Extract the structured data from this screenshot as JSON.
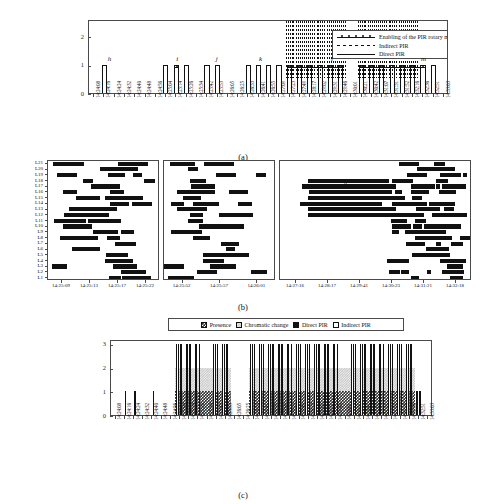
{
  "figure": {
    "panels": [
      {
        "id": "a",
        "caption": "(a)"
      },
      {
        "id": "b",
        "caption": "(b)"
      },
      {
        "id": "c",
        "caption": "(c)"
      }
    ]
  },
  "panel_a": {
    "caption": "(a)",
    "legend": {
      "items": [
        {
          "label": "Enabling of the PIR rotary mechanism",
          "symbol": "line-with-markers"
        },
        {
          "label": "Indirect PIR",
          "symbol": "dashed-line"
        },
        {
          "label": "Direct PIR",
          "symbol": "solid-line"
        }
      ]
    },
    "y_axis": {
      "ticks": [
        "0",
        "1",
        "2"
      ],
      "min": 0,
      "max": 2.6
    },
    "markers": [
      {
        "label": "h",
        "x_frac": 0.055
      },
      {
        "label": "i",
        "x_frac": 0.245
      },
      {
        "label": "j",
        "x_frac": 0.355
      },
      {
        "label": "k",
        "x_frac": 0.475
      },
      {
        "label": "l",
        "x_frac": 0.675
      },
      {
        "label": "m",
        "x_frac": 0.925
      }
    ]
  },
  "panel_b": {
    "caption": "(b)",
    "y_labels": [
      "L21",
      "L20",
      "L19",
      "L18",
      "L17",
      "L16",
      "L15",
      "L14",
      "L13",
      "L12",
      "L11",
      "L10",
      "L9",
      "L8",
      "L7",
      "L6",
      "L5",
      "L4",
      "L3",
      "L2",
      "L1"
    ],
    "annotation": "h",
    "subplots": [
      {
        "x_labels": [
          "14:25:09",
          "14:25:13",
          "14:25:17",
          "14:25:22"
        ]
      },
      {
        "x_labels": [
          "14:25:52",
          "14:25:57",
          "14:26:01"
        ]
      },
      {
        "x_labels": [
          "14:27:16",
          "14:28:17",
          "14:29:41",
          "14:30:23",
          "14:31:21",
          "14:32:18"
        ]
      }
    ]
  },
  "panel_c": {
    "caption": "(c)",
    "legend": {
      "items": [
        {
          "label": "Presence",
          "swatch": "checkered-dark"
        },
        {
          "label": "Chromatic change",
          "swatch": "checkered-light"
        },
        {
          "label": "Direct PIR",
          "swatch": "solid-black"
        },
        {
          "label": "Indirect PIR",
          "swatch": "white-outline"
        }
      ]
    },
    "y_axis": {
      "ticks": [
        "0",
        "1",
        "2",
        "3"
      ],
      "min": 0,
      "max": 3.2
    }
  },
  "x_axis_times": [
    "14:24:08",
    "14:24:16",
    "14:24:24",
    "14:24:32",
    "14:24:40",
    "14:24:48",
    "14:24:56",
    "14:25:04",
    "14:25:14",
    "14:25:26",
    "14:25:34",
    "14:25:42",
    "14:25:53",
    "14:26:05",
    "14:26:25",
    "14:26:33",
    "14:26:41",
    "14:26:55",
    "14:27:09",
    "14:27:23",
    "14:27:49",
    "14:28:17",
    "14:29:02",
    "14:29:31",
    "14:29:46",
    "14:30:01",
    "14:30:21",
    "14:30:42",
    "14:31:07",
    "14:31:31",
    "14:31:52",
    "14:32:16",
    "14:32:36",
    "14:32:51",
    "14:33:03"
  ],
  "chart_data": {
    "type": "bar",
    "title": "",
    "panels": [
      {
        "id": "a",
        "type": "bar",
        "ylabel": "",
        "xlabel": "",
        "ylim": [
          0,
          2.6
        ],
        "categories": [
          "14:24:08",
          "14:24:16",
          "14:24:24",
          "14:24:32",
          "14:24:40",
          "14:24:48",
          "14:24:56",
          "14:25:04",
          "14:25:14",
          "14:25:26",
          "14:25:34",
          "14:25:42",
          "14:25:53",
          "14:26:05",
          "14:26:25",
          "14:26:33",
          "14:26:41",
          "14:26:55",
          "14:27:09",
          "14:27:23",
          "14:27:49",
          "14:28:17",
          "14:29:02",
          "14:29:31",
          "14:29:46",
          "14:30:01",
          "14:30:21",
          "14:30:42",
          "14:31:07",
          "14:31:31",
          "14:31:52",
          "14:32:16",
          "14:32:36",
          "14:32:51",
          "14:33:03"
        ],
        "series": [
          {
            "name": "Direct PIR",
            "values": [
              0,
              1,
              0,
              0,
              0,
              0,
              0,
              1,
              1,
              1,
              0,
              1,
              1,
              0,
              0,
              1,
              1,
              1,
              1,
              1,
              1,
              1,
              1,
              1,
              1,
              0,
              1,
              1,
              1,
              1,
              1,
              1,
              1,
              1,
              0
            ]
          },
          {
            "name": "Indirect PIR",
            "values": [
              0,
              0,
              0,
              0,
              0,
              0,
              0,
              0,
              0,
              0,
              0,
              0,
              0,
              0,
              0,
              0,
              0,
              0,
              0,
              2,
              2,
              2,
              2,
              2,
              2,
              0,
              2,
              2,
              2,
              2,
              2,
              2,
              0,
              0,
              0
            ]
          },
          {
            "name": "Enabling of the PIR rotary mechanism",
            "values": [
              0,
              0,
              0,
              0,
              0,
              0,
              0,
              0,
              1,
              0,
              0,
              0,
              0,
              0,
              0,
              0,
              0,
              0,
              0,
              1,
              1,
              1,
              1,
              1,
              1,
              0,
              1,
              1,
              1,
              1,
              1,
              1,
              1,
              0,
              0
            ]
          }
        ],
        "markers": [
          "h",
          "i",
          "j",
          "k",
          "l",
          "m"
        ]
      },
      {
        "id": "b",
        "type": "heatmap",
        "ylabel": "",
        "xlabel": "",
        "rows": [
          "L21",
          "L20",
          "L19",
          "L18",
          "L17",
          "L16",
          "L15",
          "L14",
          "L13",
          "L12",
          "L11",
          "L10",
          "L9",
          "L8",
          "L7",
          "L6",
          "L5",
          "L4",
          "L3",
          "L2",
          "L1"
        ],
        "subplot_x_labels": [
          [
            "14:25:09",
            "14:25:13",
            "14:25:17",
            "14:25:22"
          ],
          [
            "14:25:52",
            "14:25:57",
            "14:26:01"
          ],
          [
            "14:27:16",
            "14:28:17",
            "14:29:41",
            "14:30:23",
            "14:31:21",
            "14:32:18"
          ]
        ],
        "note": "binary activity raster; black cells indicate active luminaire at that time"
      },
      {
        "id": "c",
        "type": "bar",
        "stacked": true,
        "ylabel": "",
        "xlabel": "",
        "ylim": [
          0,
          3.2
        ],
        "categories": [
          "14:24:08",
          "14:24:16",
          "14:24:24",
          "14:24:32",
          "14:24:40",
          "14:24:48",
          "14:24:56",
          "14:25:04",
          "14:25:14",
          "14:25:26",
          "14:25:34",
          "14:25:42",
          "14:25:53",
          "14:26:05",
          "14:26:25",
          "14:26:33",
          "14:26:41",
          "14:26:55",
          "14:27:09",
          "14:27:23",
          "14:27:49",
          "14:28:17",
          "14:29:02",
          "14:29:31",
          "14:29:46",
          "14:30:01",
          "14:30:21",
          "14:30:42",
          "14:31:07",
          "14:31:31",
          "14:31:52",
          "14:32:16",
          "14:32:36",
          "14:32:51",
          "14:33:03"
        ],
        "series": [
          {
            "name": "Presence",
            "values": [
              0,
              0,
              0,
              0,
              0,
              0,
              0,
              1,
              1,
              1,
              1,
              1,
              1,
              0,
              0,
              1,
              1,
              1,
              1,
              1,
              1,
              1,
              1,
              1,
              1,
              1,
              1,
              1,
              1,
              1,
              1,
              1,
              1,
              0,
              0
            ]
          },
          {
            "name": "Chromatic change",
            "values": [
              0,
              0,
              0,
              0,
              0,
              0,
              0,
              1,
              1,
              1,
              1,
              1,
              1,
              0,
              0,
              1,
              1,
              1,
              1,
              1,
              1,
              1,
              1,
              1,
              1,
              1,
              1,
              1,
              1,
              1,
              1,
              1,
              1,
              0,
              0
            ]
          },
          {
            "name": "Direct PIR",
            "values": [
              0,
              1,
              1,
              0,
              1,
              0,
              0,
              1,
              1,
              1,
              0,
              1,
              1,
              0,
              0,
              1,
              1,
              1,
              1,
              1,
              1,
              1,
              1,
              1,
              1,
              0,
              1,
              1,
              1,
              1,
              1,
              1,
              1,
              1,
              0
            ]
          },
          {
            "name": "Indirect PIR",
            "values": [
              0,
              0,
              0,
              0,
              0,
              0,
              0,
              1,
              1,
              1,
              0,
              1,
              1,
              0,
              0,
              1,
              1,
              1,
              1,
              1,
              1,
              1,
              1,
              1,
              1,
              0,
              1,
              1,
              1,
              1,
              1,
              1,
              1,
              1,
              0
            ]
          }
        ]
      }
    ]
  }
}
